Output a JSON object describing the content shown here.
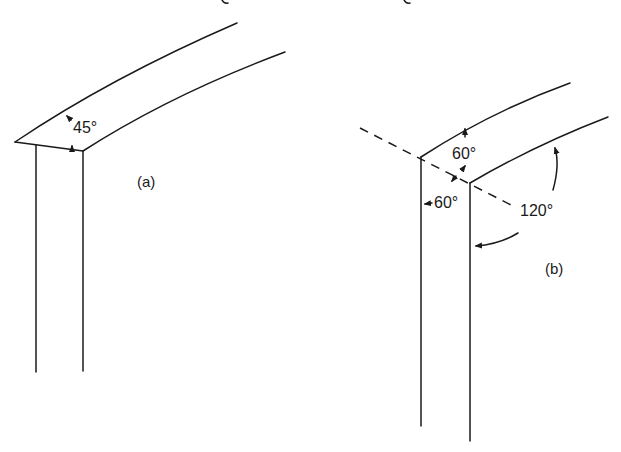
{
  "header": {
    "partial_text": "g,"
  },
  "figures": [
    {
      "id": "a",
      "label": "(a)",
      "angle_labels": [
        "45°"
      ]
    },
    {
      "id": "b",
      "label": "(b)",
      "angle_labels": [
        "60°",
        "60°",
        "120°"
      ]
    }
  ],
  "colors": {
    "line": "#1a1a1a",
    "background": "#ffffff"
  }
}
